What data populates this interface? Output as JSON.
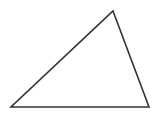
{
  "diagram": {
    "type": "triangle",
    "width": 167,
    "height": 121,
    "background": "#ffffff",
    "stroke_color": "#333333",
    "stroke_width": 1.6,
    "fill": "none",
    "vertices": {
      "apex": {
        "x": 113,
        "y": 11
      },
      "bottom_left": {
        "x": 11,
        "y": 107
      },
      "bottom_right": {
        "x": 149,
        "y": 107
      }
    }
  }
}
